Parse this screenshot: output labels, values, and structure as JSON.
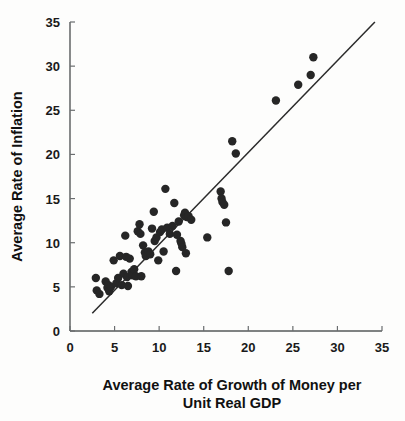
{
  "chart_data": {
    "type": "scatter",
    "title": "",
    "xlabel": "Average Rate of Growth of Money per Unit Real GDP",
    "xlabel_line1": "Average Rate of Growth of Money per",
    "xlabel_line2": "Unit Real GDP",
    "ylabel": "Average Rate of Inflation",
    "xlim": [
      0,
      35
    ],
    "ylim": [
      0,
      35
    ],
    "xticks": [
      0,
      5,
      10,
      15,
      20,
      25,
      30,
      35
    ],
    "yticks": [
      0,
      5,
      10,
      15,
      20,
      25,
      30,
      35
    ],
    "xtick_labels": [
      "0",
      "5",
      "10",
      "15",
      "20",
      "25",
      "30",
      "35"
    ],
    "ytick_labels": [
      "0",
      "5",
      "10",
      "15",
      "20",
      "25",
      "30",
      "35"
    ],
    "grid": false,
    "legend": null,
    "point_color": "#262626",
    "line_color": "#2b2b2b",
    "axis_color": "#55585a",
    "marker": "circle",
    "marker_size": 4.2,
    "trend_line": {
      "label": "fitted line",
      "x": [
        2.5,
        34.2
      ],
      "y": [
        2.0,
        35.0
      ],
      "slope": 1.04,
      "intercept": -0.6
    },
    "points": [
      {
        "x": 2.9,
        "y": 6.0
      },
      {
        "x": 3.0,
        "y": 4.6
      },
      {
        "x": 3.3,
        "y": 4.2
      },
      {
        "x": 4.0,
        "y": 5.6
      },
      {
        "x": 4.2,
        "y": 4.9
      },
      {
        "x": 4.3,
        "y": 5.2
      },
      {
        "x": 4.4,
        "y": 4.5
      },
      {
        "x": 4.6,
        "y": 5.0
      },
      {
        "x": 4.9,
        "y": 8.0
      },
      {
        "x": 5.2,
        "y": 5.4
      },
      {
        "x": 5.4,
        "y": 6.0
      },
      {
        "x": 5.6,
        "y": 8.5
      },
      {
        "x": 5.8,
        "y": 5.2
      },
      {
        "x": 6.0,
        "y": 6.5
      },
      {
        "x": 6.2,
        "y": 10.8
      },
      {
        "x": 6.3,
        "y": 8.4
      },
      {
        "x": 6.4,
        "y": 6.1
      },
      {
        "x": 6.5,
        "y": 5.1
      },
      {
        "x": 6.7,
        "y": 8.2
      },
      {
        "x": 6.9,
        "y": 6.7
      },
      {
        "x": 7.0,
        "y": 6.3
      },
      {
        "x": 7.2,
        "y": 7.0
      },
      {
        "x": 7.4,
        "y": 6.2
      },
      {
        "x": 7.6,
        "y": 11.3
      },
      {
        "x": 7.8,
        "y": 12.1
      },
      {
        "x": 7.9,
        "y": 11.0
      },
      {
        "x": 8.0,
        "y": 6.2
      },
      {
        "x": 8.2,
        "y": 9.7
      },
      {
        "x": 8.4,
        "y": 8.9
      },
      {
        "x": 8.5,
        "y": 8.5
      },
      {
        "x": 8.6,
        "y": 8.6
      },
      {
        "x": 8.8,
        "y": 9.0
      },
      {
        "x": 9.0,
        "y": 8.7
      },
      {
        "x": 9.2,
        "y": 11.6
      },
      {
        "x": 9.4,
        "y": 13.5
      },
      {
        "x": 9.5,
        "y": 10.2
      },
      {
        "x": 9.7,
        "y": 10.6
      },
      {
        "x": 9.9,
        "y": 8.0
      },
      {
        "x": 10.1,
        "y": 11.2
      },
      {
        "x": 10.3,
        "y": 11.5
      },
      {
        "x": 10.5,
        "y": 9.0
      },
      {
        "x": 10.7,
        "y": 16.1
      },
      {
        "x": 10.9,
        "y": 11.7
      },
      {
        "x": 11.2,
        "y": 11.0
      },
      {
        "x": 11.5,
        "y": 11.9
      },
      {
        "x": 11.7,
        "y": 14.5
      },
      {
        "x": 11.9,
        "y": 6.8
      },
      {
        "x": 12.0,
        "y": 10.9
      },
      {
        "x": 12.2,
        "y": 12.4
      },
      {
        "x": 12.4,
        "y": 10.2
      },
      {
        "x": 12.5,
        "y": 9.9
      },
      {
        "x": 12.6,
        "y": 9.5
      },
      {
        "x": 12.8,
        "y": 13.1
      },
      {
        "x": 12.9,
        "y": 13.4
      },
      {
        "x": 13.0,
        "y": 8.8
      },
      {
        "x": 13.1,
        "y": 12.9
      },
      {
        "x": 13.3,
        "y": 13.0
      },
      {
        "x": 13.6,
        "y": 12.6
      },
      {
        "x": 15.4,
        "y": 10.6
      },
      {
        "x": 16.9,
        "y": 15.8
      },
      {
        "x": 17.0,
        "y": 15.0
      },
      {
        "x": 17.1,
        "y": 14.6
      },
      {
        "x": 17.3,
        "y": 14.3
      },
      {
        "x": 17.5,
        "y": 12.3
      },
      {
        "x": 17.8,
        "y": 6.8
      },
      {
        "x": 18.2,
        "y": 21.5
      },
      {
        "x": 18.6,
        "y": 20.1
      },
      {
        "x": 23.1,
        "y": 26.1
      },
      {
        "x": 25.6,
        "y": 27.9
      },
      {
        "x": 27.0,
        "y": 29.0
      },
      {
        "x": 27.3,
        "y": 31.0
      }
    ]
  },
  "geometry": {
    "plot_left_px": 70,
    "plot_right_px": 382,
    "plot_bottom_px": 331,
    "plot_top_px": 22
  }
}
